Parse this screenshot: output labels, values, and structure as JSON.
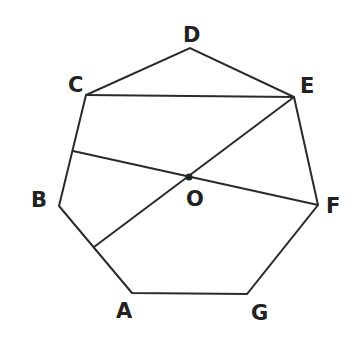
{
  "diagram": {
    "type": "heptagon-geometry",
    "stroke_color": "#2a2a2a",
    "vertices": {
      "A": {
        "x": 132,
        "y": 293
      },
      "B": {
        "x": 59,
        "y": 206
      },
      "C": {
        "x": 86,
        "y": 95
      },
      "D": {
        "x": 190,
        "y": 48
      },
      "E": {
        "x": 294,
        "y": 97
      },
      "F": {
        "x": 318,
        "y": 205
      },
      "G": {
        "x": 247,
        "y": 294
      }
    },
    "center": {
      "label": "O",
      "x": 189,
      "y": 177
    },
    "segments": [
      {
        "from": "C",
        "to": "E"
      },
      {
        "from": "E",
        "to": "point-on-AB",
        "through": "O"
      },
      {
        "from": "point-on-BC",
        "to": "F",
        "through": "O"
      }
    ],
    "labels": {
      "A": "A",
      "B": "B",
      "C": "C",
      "D": "D",
      "E": "E",
      "F": "F",
      "G": "G",
      "O": "O"
    }
  }
}
